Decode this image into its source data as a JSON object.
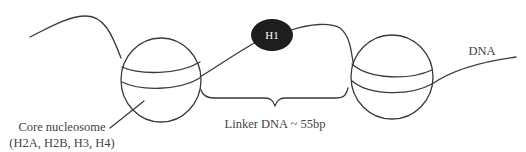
{
  "diagram": {
    "labels": {
      "h1": "H1",
      "dna": "DNA",
      "linker": "Linker DNA ~ 55bp",
      "core_line1": "Core nucleosome",
      "core_line2": "(H2A, H2B, H3, H4)"
    },
    "nodes": [
      {
        "id": "core-nucleosome-left",
        "shape": "sphere",
        "label": "Core nucleosome (H2A, H2B, H3, H4)"
      },
      {
        "id": "histone-h1",
        "shape": "filled-ellipse",
        "label": "H1"
      },
      {
        "id": "core-nucleosome-right",
        "shape": "sphere",
        "label": ""
      }
    ],
    "edges": [
      {
        "from": "dna-left-end",
        "to": "core-nucleosome-left",
        "type": "dna-strand"
      },
      {
        "from": "core-nucleosome-left",
        "to": "histone-h1",
        "type": "dna-strand"
      },
      {
        "from": "histone-h1",
        "to": "core-nucleosome-right",
        "type": "dna-strand"
      },
      {
        "from": "core-nucleosome-right",
        "to": "dna-right-end",
        "type": "dna-strand",
        "label": "DNA"
      }
    ],
    "annotations": [
      {
        "type": "brace",
        "spans": "between nucleosomes",
        "label": "Linker DNA ~ 55bp"
      },
      {
        "type": "leader-line",
        "target": "core-nucleosome-left",
        "label": "Core nucleosome (H2A, H2B, H3, H4)"
      }
    ],
    "colors": {
      "stroke": "#3a3a3a",
      "h1_fill": "#1e1e1e",
      "text": "#444444",
      "background": "#ffffff"
    }
  }
}
